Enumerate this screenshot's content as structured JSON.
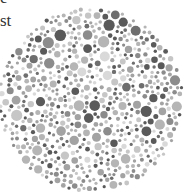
{
  "caption": {
    "line1": "e·",
    "line2": "st"
  },
  "plate": {
    "type": "color-vision-test-plate",
    "palette": [
      "#5a5a5a",
      "#6e6e6e",
      "#8c8c8c",
      "#a3a3a3",
      "#b5b5b5",
      "#c6c6c6",
      "#d9d9d9"
    ],
    "background": "#ffffff"
  }
}
